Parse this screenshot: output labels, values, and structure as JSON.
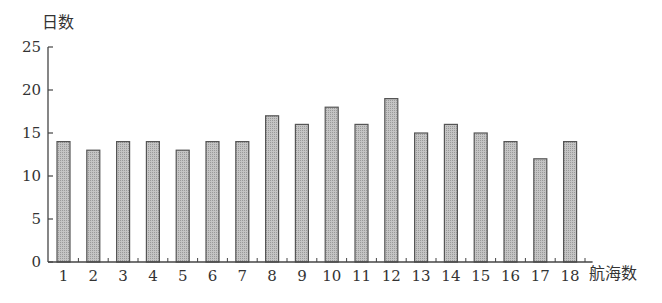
{
  "chart_data": {
    "type": "bar",
    "title": "",
    "xlabel": "航海数",
    "ylabel": "日数",
    "categories": [
      "1",
      "2",
      "3",
      "4",
      "5",
      "6",
      "7",
      "8",
      "9",
      "10",
      "11",
      "12",
      "13",
      "14",
      "15",
      "16",
      "17",
      "18"
    ],
    "values": [
      14,
      13,
      14,
      14,
      13,
      14,
      14,
      17,
      16,
      18,
      16,
      19,
      15,
      16,
      15,
      14,
      12,
      14
    ],
    "ylim": [
      0,
      25
    ],
    "yticks": [
      0,
      5,
      10,
      15,
      20,
      25
    ],
    "grid": false,
    "legend": null,
    "bar_fill": "#b8b8b8",
    "bar_stroke": "#555555"
  }
}
